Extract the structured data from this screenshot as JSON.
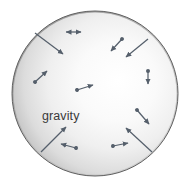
{
  "figure": {
    "background_color": "#ffffff",
    "sphere": {
      "name": "sphere",
      "center_x": 95,
      "center_y": 93.5,
      "radius_x": 83,
      "radius_y": 82.5,
      "edge_color": "#5f5f5f",
      "fill_light": "#fdfdfd",
      "fill_mid": "#e3e3e3",
      "fill_dark": "#9a9a9a",
      "highlight_x": "62%",
      "highlight_y": "44%"
    },
    "label": {
      "text": "gravity",
      "x": 42,
      "y": 120,
      "color": "#3a3a3a",
      "font_size": 12.5
    },
    "arrow_color": "#555f6b",
    "gravity_lines": [
      {
        "name": "gravity-line-top-left",
        "x1": 35,
        "y1": 33,
        "x2": 63,
        "y2": 54
      },
      {
        "name": "gravity-line-top-right",
        "x1": 148,
        "y1": 39,
        "x2": 126,
        "y2": 57
      },
      {
        "name": "gravity-line-bottom-left",
        "x1": 41,
        "y1": 152,
        "x2": 66,
        "y2": 127
      },
      {
        "name": "gravity-line-bottom-right",
        "x1": 152,
        "y1": 152,
        "x2": 126,
        "y2": 128
      }
    ],
    "vectors": [
      {
        "name": "vector-top-center",
        "x1": 66,
        "y1": 32,
        "x2": 81,
        "y2": 32,
        "double": true
      },
      {
        "name": "vector-upper-right",
        "x1": 122,
        "y1": 39,
        "x2": 111,
        "y2": 51,
        "double": false
      },
      {
        "name": "vector-left-upper",
        "x1": 35,
        "y1": 82,
        "x2": 47,
        "y2": 71,
        "double": false
      },
      {
        "name": "vector-center",
        "x1": 77,
        "y1": 90,
        "x2": 93,
        "y2": 85,
        "double": false
      },
      {
        "name": "vector-right-mid",
        "x1": 148,
        "y1": 71,
        "x2": 148,
        "y2": 84,
        "double": false
      },
      {
        "name": "vector-right-lower",
        "x1": 137,
        "y1": 110,
        "x2": 149,
        "y2": 124,
        "double": false
      },
      {
        "name": "vector-bottom-left",
        "x1": 76,
        "y1": 148,
        "x2": 61,
        "y2": 144,
        "double": false
      },
      {
        "name": "vector-bottom-right",
        "x1": 113,
        "y1": 146,
        "x2": 128,
        "y2": 143,
        "double": true
      }
    ]
  }
}
